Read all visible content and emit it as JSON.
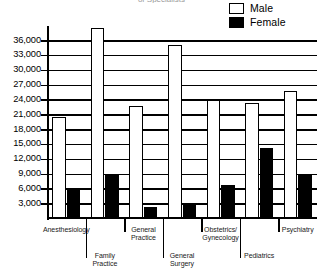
{
  "chart_data": {
    "type": "bar",
    "title": "of Specialists",
    "categories": [
      "Anesthesiology",
      "Family Practice",
      "General Practice",
      "General Surgery",
      "Obstetrics/ Gynecology",
      "Pediatrics",
      "Psychiatry"
    ],
    "series": [
      {
        "name": "Male",
        "color": "#ffffff",
        "values": [
          20500,
          38500,
          22700,
          35000,
          23800,
          23300,
          25700
        ]
      },
      {
        "name": "Female",
        "color": "#000000",
        "values": [
          5800,
          8800,
          2300,
          2800,
          6700,
          14200,
          8600
        ]
      }
    ],
    "ylim": [
      0,
      39000
    ],
    "ytick_values": [
      3000,
      6000,
      9000,
      12000,
      15000,
      18000,
      21000,
      24000,
      27000,
      30000,
      33000,
      36000
    ],
    "ytick_labels": [
      "3,000",
      "6,000",
      "9,000",
      "12,000",
      "15,000",
      "18,000",
      "21,000",
      "24,000",
      "27,000",
      "30,000",
      "33,000",
      "36,000"
    ],
    "xlabel": "",
    "ylabel": "",
    "grid": true,
    "legend_position": "top-right"
  },
  "legend": {
    "items": [
      {
        "label": "Male",
        "swatch": "white-outlined-square"
      },
      {
        "label": "Female",
        "swatch": "black-filled-square"
      }
    ]
  },
  "category_label_rows": [
    {
      "text": "Anesthesiology",
      "row": 0
    },
    {
      "text": "Family\nPractice",
      "row": 1
    },
    {
      "text": "General\nPractice",
      "row": 0
    },
    {
      "text": "General\nSurgery",
      "row": 1
    },
    {
      "text": "Obstetrics/\nGynecology",
      "row": 0
    },
    {
      "text": "Pediatrics",
      "row": 1
    },
    {
      "text": "Psychiatry",
      "row": 0
    }
  ]
}
